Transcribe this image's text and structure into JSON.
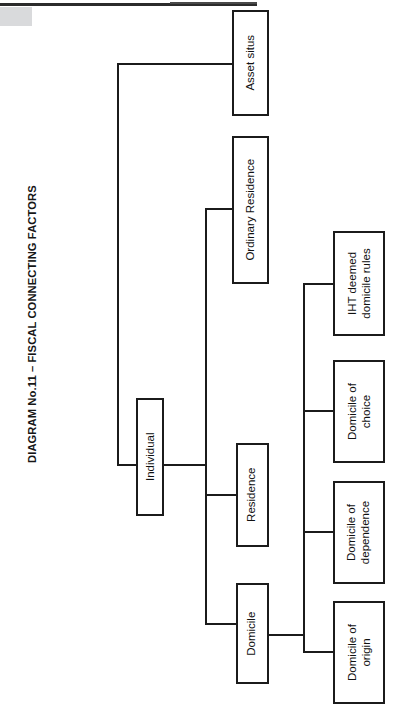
{
  "page": {
    "title": "DIAGRAM No.11 – FISCAL CONNECTING FACTORS",
    "background": "#ffffff",
    "line_color": "#1b1b1b",
    "corner_block_color": "#d9dadc"
  },
  "diagram": {
    "type": "tree",
    "orientation": "left-to-right, text rotated 90 degrees counter-clockwise",
    "root": "Individual",
    "nodes": [
      {
        "id": "individual",
        "label": "Individual",
        "level": 1
      },
      {
        "id": "asset-situs",
        "label": "Asset situs",
        "level": 2
      },
      {
        "id": "ordinary-residence",
        "label": "Ordinary Residence",
        "level": 2
      },
      {
        "id": "residence",
        "label": "Residence",
        "level": 2
      },
      {
        "id": "domicile",
        "label": "Domicile",
        "level": 2
      },
      {
        "id": "iht-deemed-domicile-rules",
        "label": "IHT deemed\ndomicile rules",
        "level": 3
      },
      {
        "id": "domicile-of-choice",
        "label": "Domicile of\nchoice",
        "level": 3
      },
      {
        "id": "domicile-of-dependence",
        "label": "Domicile of\ndependence",
        "level": 3
      },
      {
        "id": "domicile-of-origin",
        "label": "Domicile of\norigin",
        "level": 3
      }
    ],
    "edges": [
      {
        "from": "individual",
        "to": "asset-situs"
      },
      {
        "from": "individual",
        "to": "ordinary-residence"
      },
      {
        "from": "individual",
        "to": "residence"
      },
      {
        "from": "individual",
        "to": "domicile"
      },
      {
        "from": "domicile",
        "to": "iht-deemed-domicile-rules"
      },
      {
        "from": "domicile",
        "to": "domicile-of-choice"
      },
      {
        "from": "domicile",
        "to": "domicile-of-dependence"
      },
      {
        "from": "domicile",
        "to": "domicile-of-origin"
      }
    ]
  }
}
